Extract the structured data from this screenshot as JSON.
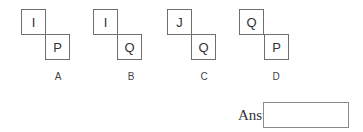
{
  "options": [
    {
      "label": "A",
      "top_letter": "I",
      "bottom_letter": "P"
    },
    {
      "label": "B",
      "top_letter": "I",
      "bottom_letter": "Q"
    },
    {
      "label": "C",
      "top_letter": "J",
      "bottom_letter": "Q"
    },
    {
      "label": "D",
      "top_letter": "Q",
      "bottom_letter": "P"
    }
  ],
  "answer": {
    "label": "Answer:",
    "value": ""
  }
}
